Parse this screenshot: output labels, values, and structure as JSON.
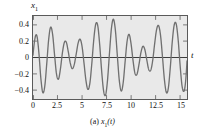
{
  "figure": {
    "caption_prefix": "(a) ",
    "caption_var": "x",
    "caption_sub": "1",
    "caption_arg": "(t)",
    "y_axis_label_var": "x",
    "y_axis_label_sub": "1",
    "x_axis_label": "t",
    "background_color": "#e9e9e9",
    "curve_color": "#707070",
    "axis_color": "#5a5a5a"
  },
  "chart_data": {
    "type": "line",
    "title": "(a) x1(t)",
    "xlabel": "t",
    "ylabel": "x1",
    "xlim": [
      0,
      15.7
    ],
    "ylim": [
      -0.52,
      0.52
    ],
    "grid": false,
    "legend": null,
    "xticks": [
      "0",
      "2.5",
      "5",
      "7.5",
      "10",
      "12.5",
      "15"
    ],
    "xtick_values": [
      0,
      2.5,
      5,
      7.5,
      10,
      12.5,
      15
    ],
    "yticks": [
      "0.4",
      "0.2",
      "0",
      "−0.2",
      "−0.4"
    ],
    "ytick_values": [
      0.4,
      0.2,
      0,
      -0.2,
      -0.4
    ],
    "series": [
      {
        "name": "x1(t)",
        "color": "#707070",
        "model": "0.27*(sin(2.36*t) + sin(2.73*t))",
        "x": [
          0.0,
          0.2,
          0.4,
          0.6,
          0.8,
          1.0,
          1.2,
          1.4,
          1.6,
          1.8,
          2.0,
          2.2,
          2.4,
          2.6,
          2.8,
          3.0,
          3.2,
          3.4,
          3.6,
          3.8,
          4.0,
          4.2,
          4.4,
          4.6,
          4.8,
          5.0,
          5.2,
          5.4,
          5.6,
          5.8,
          6.0,
          6.2,
          6.4,
          6.6,
          6.8,
          7.0,
          7.2,
          7.4,
          7.6,
          7.8,
          8.0,
          8.2,
          8.4,
          8.6,
          8.8,
          9.0,
          9.2,
          9.4,
          9.6,
          9.8,
          10.0,
          10.2,
          10.4,
          10.6,
          10.8,
          11.0,
          11.2,
          11.4,
          11.6,
          11.8,
          12.0,
          12.2,
          12.4,
          12.6,
          12.8,
          13.0,
          13.2,
          13.4,
          13.6,
          13.8,
          14.0,
          14.2,
          14.4,
          14.6,
          14.8,
          15.0,
          15.2,
          15.4,
          15.7
        ],
        "y": [
          0.0,
          0.24,
          0.27,
          0.06,
          -0.26,
          -0.44,
          -0.36,
          -0.08,
          0.23,
          0.38,
          0.29,
          0.03,
          -0.21,
          -0.27,
          -0.14,
          0.06,
          0.19,
          0.19,
          0.07,
          -0.07,
          -0.14,
          -0.09,
          0.04,
          0.18,
          0.23,
          0.14,
          -0.07,
          -0.29,
          -0.4,
          -0.32,
          -0.07,
          0.23,
          0.42,
          0.4,
          0.16,
          -0.17,
          -0.42,
          -0.47,
          -0.28,
          0.06,
          0.37,
          0.48,
          0.34,
          0.02,
          -0.29,
          -0.42,
          -0.31,
          -0.04,
          0.21,
          0.29,
          0.17,
          -0.04,
          -0.2,
          -0.21,
          -0.09,
          0.06,
          0.14,
          0.1,
          -0.03,
          -0.15,
          -0.16,
          -0.04,
          0.17,
          0.35,
          0.4,
          0.28,
          0.01,
          -0.28,
          -0.44,
          -0.38,
          -0.12,
          0.2,
          0.41,
          0.42,
          0.22,
          -0.1,
          -0.36,
          -0.42,
          -0.26
        ]
      }
    ]
  }
}
